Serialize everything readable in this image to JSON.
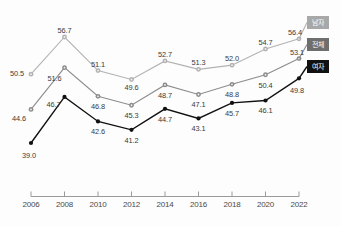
{
  "chart_data": {
    "type": "line",
    "title": "",
    "subtitle": "",
    "xlabel": "",
    "ylabel": "",
    "x": [
      2006,
      2008,
      2010,
      2012,
      2014,
      2016,
      2018,
      2020,
      2022
    ],
    "categories": [
      "2006",
      "2008",
      "2010",
      "2012",
      "2014",
      "2016",
      "2018",
      "2020",
      "2022"
    ],
    "xlim": [
      2005,
      2023
    ],
    "ylim": [
      37.0,
      58.5
    ],
    "grid": false,
    "legend_position": "right-inline-end-of-line",
    "series": [
      {
        "name": "남자",
        "color": "#b2b2b2",
        "marker": "circle",
        "values": [
          50.5,
          56.7,
          51.1,
          49.6,
          52.7,
          51.3,
          52.0,
          54.7,
          56.4
        ],
        "labels": [
          "50.5",
          "56.7",
          "51.1",
          "49.6",
          "52.7",
          "51.3",
          "52.0",
          "54.7",
          "56.4"
        ]
      },
      {
        "name": "전체",
        "color": "#8c8c8c",
        "marker": "circle",
        "values": [
          44.6,
          51.6,
          46.8,
          45.3,
          48.7,
          47.1,
          48.8,
          50.4,
          53.1
        ],
        "labels": [
          "44.6",
          "51.6",
          "46.8",
          "45.3",
          "48.7",
          "47.1",
          "48.8",
          "50.4",
          "53.1"
        ]
      },
      {
        "name": "여자",
        "color": "#111111",
        "marker": "circle",
        "values": [
          39.0,
          46.7,
          42.6,
          41.2,
          44.7,
          43.1,
          45.7,
          46.1,
          49.8
        ],
        "labels": [
          "39.0",
          "46.7",
          "42.6",
          "41.2",
          "44.7",
          "43.1",
          "45.7",
          "46.1",
          "49.8"
        ]
      }
    ]
  },
  "legend": {
    "male": "남자",
    "total": "전체",
    "female": "여자"
  },
  "axis": {
    "ticks": [
      "2006",
      "2008",
      "2010",
      "2012",
      "2014",
      "2016",
      "2018",
      "2020",
      "2022"
    ],
    "line_color": "#9a9a9a"
  },
  "colors": {
    "male_line": "#b2b2b2",
    "total_line": "#8c8c8c",
    "female_line": "#111111",
    "background": "#fdfdfd",
    "label_text": "#3a3a3a"
  }
}
